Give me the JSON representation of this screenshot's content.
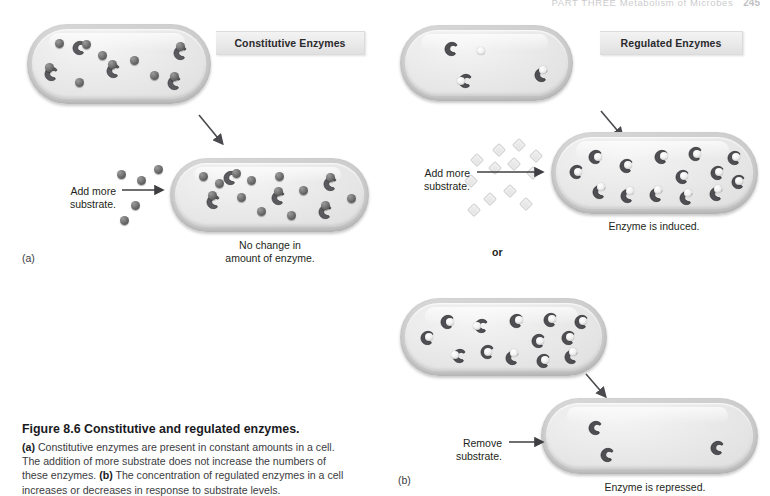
{
  "running_head": {
    "text": "PART THREE  Metabolism of Microbes",
    "page_number": "245"
  },
  "banners": {
    "constitutive": "Constitutive Enzymes",
    "regulated": "Regulated Enzymes"
  },
  "panel_labels": {
    "a": "(a)",
    "b": "(b)"
  },
  "connector": {
    "or": "or"
  },
  "panel_a": {
    "add_substrate": "Add more\nsubstrate.",
    "result": "No change in\namount of enzyme.",
    "cell_top": {
      "enzyme_count": 5,
      "free_substrate_count": 5
    },
    "cell_bottom": {
      "enzyme_count": 5,
      "free_substrate_count": 9
    },
    "external_substrate_count": 5
  },
  "panel_b": {
    "add_substrate": "Add more\nsubstrate.",
    "remove_substrate": "Remove\nsubstrate.",
    "result_induced": "Enzyme is induced.",
    "result_repressed": "Enzyme is repressed.",
    "cell_top": {
      "enzyme_count": 3,
      "bound_substrate_count": 2,
      "free_substrate_count": 1
    },
    "cell_induced": {
      "enzyme_count": 14,
      "bound_substrate_count": 14
    },
    "cell_full": {
      "enzyme_count": 13,
      "bound_substrate_count": 13
    },
    "cell_repressed": {
      "enzyme_count": 3,
      "bound_substrate_count": 0
    },
    "external_substrate_count": 12
  },
  "caption": {
    "title": "Figure 8.6  Constitutive and regulated enzymes.",
    "a_tag": "(a)",
    "a_text": " Constitutive enzymes are present in constant amounts in a cell. The addition of more substrate does not increase the numbers of these enzymes. ",
    "b_tag": "(b)",
    "b_text": " The concentration of regulated enzymes in a cell increases or decreases in response to substrate levels."
  },
  "colors": {
    "enzyme_dark": "#5a5a5f",
    "enzyme_edge": "#3c3c40",
    "cell_fill": "#e8e8e8",
    "cell_border": "#c6c6c6",
    "banner_fill": "#ecECec",
    "text": "#231f20"
  }
}
